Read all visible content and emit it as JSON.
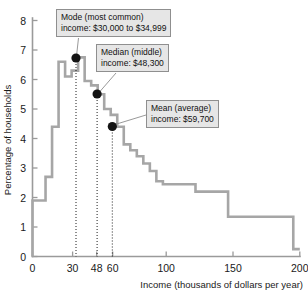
{
  "chart_data": {
    "type": "line",
    "title": "",
    "subtitle": "",
    "xlabel": "Income (thousands of dollars per year)",
    "ylabel": "Percentage of households",
    "xlim": [
      0,
      205
    ],
    "ylim": [
      0,
      8.4
    ],
    "grid": false,
    "legend_position": "none",
    "xticks": [
      0,
      30,
      48,
      60,
      100,
      150,
      200
    ],
    "xtick_labels": [
      "0",
      "30",
      "48",
      "60",
      "100",
      "150",
      "200"
    ],
    "yticks": [
      0,
      1,
      2,
      3,
      4,
      5,
      6,
      7,
      8
    ],
    "ytick_labels": [
      "0",
      "1",
      "2",
      "3",
      "4",
      "5",
      "6",
      "7",
      "8"
    ],
    "bin_edges": [
      0,
      5,
      10,
      15,
      20,
      25,
      30,
      35,
      40,
      45,
      50,
      55,
      60,
      65,
      70,
      75,
      80,
      85,
      90,
      95,
      100,
      125,
      150,
      200
    ],
    "bin_values": [
      1.9,
      1.9,
      2.7,
      4.4,
      6.6,
      6.1,
      6.3,
      6.75,
      5.95,
      5.8,
      5.5,
      5.0,
      4.8,
      4.4,
      3.8,
      3.6,
      3.4,
      3.15,
      2.9,
      2.55,
      2.45,
      2.2,
      1.35,
      0.25
    ],
    "annotations": [
      {
        "name": "mode",
        "line1": "Mode (most common)",
        "line2": "income: $30,000 to $34,999",
        "point_x": 32.5,
        "point_y": 6.7
      },
      {
        "name": "median",
        "line1": "Median (middle)",
        "line2": "income: $48,300",
        "point_x": 48.3,
        "point_y": 5.5
      },
      {
        "name": "mean",
        "line1": "Mean (average)",
        "line2": "income: $59,700",
        "point_x": 59.7,
        "point_y": 4.4
      }
    ],
    "colors": {
      "step_line": "#a6a6a6",
      "axis": "#9a9a9a",
      "marker": "#141414",
      "callout_background": "#e6e6e6",
      "callout_border": "#8f8f8f",
      "text": "#1a1a1a",
      "background": "#ffffff"
    }
  }
}
